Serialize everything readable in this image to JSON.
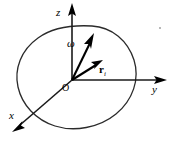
{
  "figure": {
    "caption": "",
    "background_color": "#ffffff",
    "width": 171,
    "height": 142,
    "axes": {
      "z": {
        "label": "z",
        "direction": "up",
        "color": "#1a1a1a"
      },
      "y": {
        "label": "y",
        "direction": "right",
        "color": "#1a1a1a"
      },
      "x": {
        "label": "x",
        "direction": "lower-left",
        "color": "#1a1a1a"
      }
    },
    "origin": {
      "label": "O",
      "color": "#000000"
    },
    "vectors": [
      {
        "label": "ω",
        "name": "angular-velocity",
        "style": "italic",
        "color": "#000000",
        "from": "O",
        "direction": "upper-right-steep"
      },
      {
        "label": "r",
        "subscript": "i",
        "name": "position-vector",
        "style": "bold",
        "color": "#000000",
        "from": "O",
        "direction": "upper-right-shallow"
      }
    ],
    "body": {
      "name": "rigid-body-outline",
      "shape": "irregular-blob",
      "color": "#2b2b2b",
      "fill": "none"
    }
  }
}
